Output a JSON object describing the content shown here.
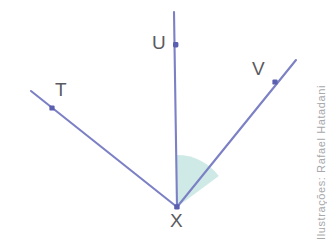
{
  "figure": {
    "type": "geometry-angle-diagram",
    "vertex": {
      "id": "X",
      "label": "X",
      "x": 177,
      "y": 207
    },
    "points": [
      {
        "id": "U",
        "label": "U",
        "x": 176,
        "y": 45,
        "marker": true
      },
      {
        "id": "T",
        "label": "T",
        "x": 52,
        "y": 108,
        "marker": true
      },
      {
        "id": "V",
        "label": "V",
        "x": 275,
        "y": 82,
        "marker": true
      }
    ],
    "rays": [
      {
        "id": "ray-XU",
        "from": "X",
        "through": "U",
        "end_x": 174,
        "end_y": 12
      },
      {
        "id": "ray-XT",
        "from": "X",
        "through": "T",
        "end_x": 31,
        "end_y": 91
      },
      {
        "id": "ray-XV",
        "from": "X",
        "through": "V",
        "end_x": 296,
        "end_y": 60
      }
    ],
    "shaded_angle": {
      "id": "angle-UXV",
      "between": [
        "ray-XU",
        "ray-XV"
      ],
      "radius": 52,
      "fill": "#cfeae6"
    },
    "colors": {
      "ray_stroke": "#7c80c4",
      "marker_fill": "#5a5fb0",
      "angle_fill": "#cfeae6",
      "label_text": "#5b5b5f",
      "credit_text": "#a8a8ad",
      "background": "#ffffff"
    }
  },
  "credit": {
    "text": "Ilustrações: Rafael Hatadani"
  }
}
